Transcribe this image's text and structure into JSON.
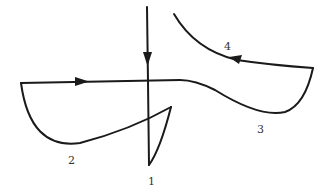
{
  "diagram": {
    "colors": {
      "stroke": "#1a1a1a",
      "label": "#333333",
      "background": "#ffffff"
    },
    "labels": [
      {
        "id": "1",
        "text": "1"
      },
      {
        "id": "2",
        "text": "2"
      },
      {
        "id": "3",
        "text": "3"
      },
      {
        "id": "4",
        "text": "4"
      }
    ],
    "arrows": [
      {
        "segment": "vertical-entry",
        "direction": "down"
      },
      {
        "segment": "horizontal-top",
        "direction": "right"
      },
      {
        "segment": "4",
        "direction": "left"
      }
    ]
  }
}
